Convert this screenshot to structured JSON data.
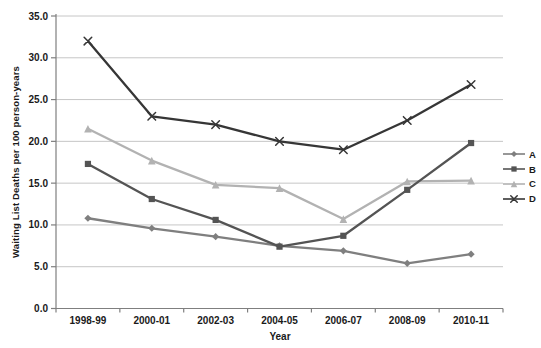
{
  "chart_data": {
    "type": "line",
    "title": "",
    "xlabel": "Year",
    "ylabel": "Waiting List Deaths per 100 person-years",
    "categories": [
      "1998-99",
      "2000-01",
      "2002-03",
      "2004-05",
      "2006-07",
      "2008-09",
      "2010-11"
    ],
    "series": [
      {
        "name": "A",
        "marker": "diamond",
        "color": "#7f7f7f",
        "values": [
          10.8,
          9.6,
          8.6,
          7.5,
          6.9,
          5.4,
          6.5
        ]
      },
      {
        "name": "B",
        "marker": "square",
        "color": "#545454",
        "values": [
          17.3,
          13.1,
          10.6,
          7.4,
          8.7,
          14.2,
          19.8
        ]
      },
      {
        "name": "C",
        "marker": "triangle",
        "color": "#b2b2b2",
        "values": [
          21.5,
          17.7,
          14.8,
          14.4,
          10.7,
          15.2,
          15.3
        ]
      },
      {
        "name": "D",
        "marker": "x",
        "color": "#363636",
        "values": [
          32.0,
          23.0,
          22.0,
          20.0,
          19.0,
          22.5,
          26.8
        ]
      }
    ],
    "ylim": [
      0,
      35
    ],
    "ytick_step": 5,
    "ytick_labels": [
      "0.0",
      "5.0",
      "10.0",
      "15.0",
      "20.0",
      "25.0",
      "30.0",
      "35.0"
    ],
    "grid": true,
    "legend_position": "right",
    "legend_labels": [
      "A",
      "B",
      "C",
      "D"
    ]
  },
  "colors": {
    "gridline": "#c6c6c6",
    "axis": "#7f7f7f",
    "background": "#ffffff",
    "text": "#1a1a1a"
  }
}
